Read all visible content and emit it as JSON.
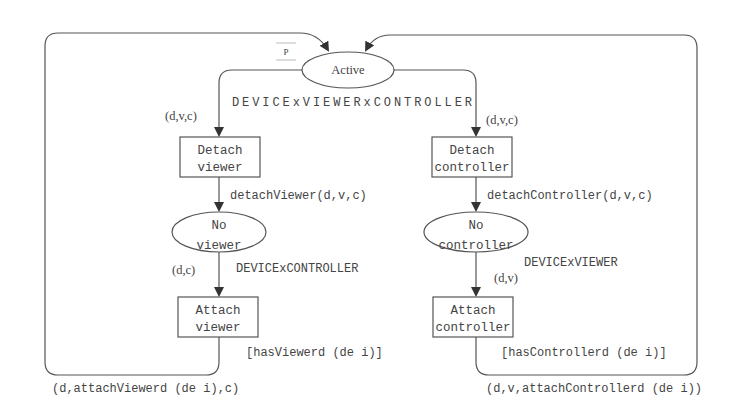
{
  "diagram": {
    "type": "colored-petri-net",
    "places": {
      "active": {
        "line1": "Active",
        "line2": ""
      },
      "no_viewer": {
        "line1": "No",
        "line2": "viewer"
      },
      "no_controller": {
        "line1": "No",
        "line2": "controller"
      }
    },
    "transitions": {
      "detach_viewer": {
        "line1": "Detach",
        "line2": "viewer"
      },
      "attach_viewer": {
        "line1": "Attach",
        "line2": "viewer"
      },
      "detach_controller": {
        "line1": "Detach",
        "line2": "controller"
      },
      "attach_controller": {
        "line1": "Attach",
        "line2": "controller"
      }
    },
    "color_sets": {
      "active": "DEVICExVIEWERxCONTROLLER",
      "no_viewer": "DEVICExCONTROLLER",
      "no_controller": "DEVICExVIEWER"
    },
    "arc_labels": {
      "active_to_detach_viewer": "(d,v,c)",
      "active_to_detach_controller": "(d,v,c)",
      "detach_viewer_to_no_viewer": "detachViewer(d,v,c)",
      "detach_controller_to_no_controller": "detachController(d,v,c)",
      "no_viewer_to_attach_viewer": "(d,c)",
      "no_controller_to_attach_controller": "(d,v)",
      "attach_viewer_to_active": "(d,attachViewerd (de i),c)",
      "attach_controller_to_active": "(d,v,attachControllerd (de i))"
    },
    "guards": {
      "attach_viewer": "[hasViewerd (de i)]",
      "attach_controller": "[hasControllerd (de i)]"
    },
    "marking_label": "P"
  }
}
